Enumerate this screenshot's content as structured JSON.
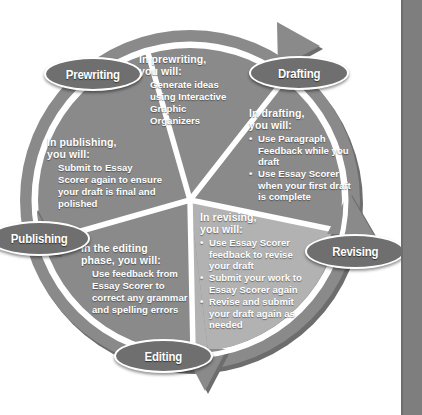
{
  "diagram": {
    "type": "cycle-diagram",
    "colors": {
      "wedge_fill": "#8a8a8a",
      "wedge_fill_highlight": "#b2b2b2",
      "ring_fill": "#8a8a8a",
      "ring_shadow": "#6b6b6b",
      "divider": "#ffffff",
      "pill_fill": "#6f6f6f",
      "pill_border": "#ffffff",
      "text": "#ffffff",
      "page_margin": "#7e7e7e",
      "background": "#ffffff"
    },
    "stages": [
      {
        "id": "prewriting",
        "pill_label": "Prewriting",
        "heading": "In prewriting, you will:",
        "heading_line1": "In prewriting,",
        "heading_line2": "you will:",
        "list_style": "plain",
        "items": [
          "Generate ideas",
          "using Interactive",
          "Graphic",
          "Organizers"
        ]
      },
      {
        "id": "drafting",
        "pill_label": "Drafting",
        "heading": "In drafting, you will:",
        "heading_line1": "In drafting,",
        "heading_line2": "you will:",
        "list_style": "bulleted",
        "items": [
          "Use Paragraph Feedback while you draft",
          "Use Essay Scorer when your first draft is complete"
        ]
      },
      {
        "id": "revising",
        "pill_label": "Revising",
        "heading": "In revising, you will:",
        "heading_line1": "In revising,",
        "heading_line2": "you will:",
        "list_style": "bulleted",
        "items": [
          "Use Essay Scorer feedback to revise your draft",
          "Submit your work to Essay Scorer again",
          "Revise and submit your draft again as needed"
        ]
      },
      {
        "id": "editing",
        "pill_label": "Editing",
        "heading": "In the editing phase, you will:",
        "heading_line1": "In the editing",
        "heading_line2": "phase, you will:",
        "list_style": "plain",
        "items": [
          "Use feedback from",
          "Essay Scorer to",
          "correct any grammar",
          "and spelling errors"
        ]
      },
      {
        "id": "publishing",
        "pill_label": "Publishing",
        "heading": "In publishing, you will:",
        "heading_line1": "In publishing,",
        "heading_line2": "you will:",
        "list_style": "plain",
        "items": [
          "Submit to Essay",
          "Scorer again to ensure",
          "your draft is final and",
          "polished"
        ]
      }
    ],
    "arrows": [
      {
        "id": "arrow-top-right",
        "direction": "clockwise"
      },
      {
        "id": "arrow-right",
        "direction": "clockwise"
      },
      {
        "id": "arrow-bottom",
        "direction": "clockwise"
      },
      {
        "id": "arrow-left",
        "direction": "clockwise"
      }
    ]
  }
}
